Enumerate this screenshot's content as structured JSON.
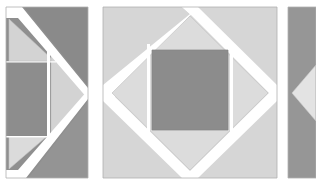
{
  "figure": {
    "canvas": {
      "width": 316,
      "height": 185,
      "background": "#ffffff"
    },
    "palette": {
      "dark_gray": "#8c8c8c",
      "mid_gray": "#9a9a9a",
      "light_gray": "#d4d4d4",
      "pale_gray": "#dcdcdc",
      "very_light_gray": "#e3e3e3",
      "white_gap": "#ffffff",
      "outline": "#b5b5b5"
    },
    "panels": [
      {
        "id": "panel-left",
        "label": "Left panel",
        "x": 6,
        "y": 7,
        "width": 82,
        "height": 171,
        "base_fill": "#8c8c8c",
        "shapes": [
          {
            "name": "upper-left-triangle",
            "fill": "#d4d4d4",
            "points": "6,17 6,62 58,62"
          },
          {
            "name": "left-rectangle",
            "fill": "#8e8e8e",
            "points": "6,62 46,62 46,137 6,137"
          },
          {
            "name": "lower-left-triangle",
            "fill": "#dcdcdc",
            "points": "6,137 46,137 6,172"
          },
          {
            "name": "inner-right-triangle",
            "fill": "#d4d4d4",
            "points": "50,50 50,140 86,95"
          },
          {
            "name": "upper-right-dark",
            "fill": "#8c8c8c",
            "points": "22,7 88,7 88,88"
          },
          {
            "name": "lower-right-dark",
            "fill": "#969696",
            "points": "88,100 88,178 26,178"
          }
        ]
      },
      {
        "id": "panel-middle",
        "label": "Middle panel",
        "x": 103,
        "y": 7,
        "width": 174,
        "height": 171,
        "base_fill": "#d6d6d6",
        "shapes": [
          {
            "name": "background-square",
            "fill": "#d6d6d6",
            "points": "103,7 277,7 277,178 103,178"
          },
          {
            "name": "inner-diamond",
            "fill": "#dcdcdc",
            "points": "190,16 268,93 190,170 112,93"
          },
          {
            "name": "center-square",
            "fill": "#8c8c8c",
            "points": "152,50 228,50 228,130 152,130"
          }
        ],
        "gaps": [
          {
            "name": "diamond-gap-top-left",
            "points": "103,7 190,7 190,16 112,93 103,93"
          },
          {
            "name": "diamond-gap-top-right",
            "points": "190,7 277,7 277,93 268,93 190,16"
          },
          {
            "name": "diamond-gap-bottom-right",
            "points": "277,93 277,178 190,178 190,170 268,93"
          },
          {
            "name": "diamond-gap-bottom-left",
            "points": "103,93 112,93 190,170 190,178 103,178"
          }
        ]
      },
      {
        "id": "panel-right",
        "label": "Right panel (clipped by canvas edge)",
        "x": 288,
        "y": 7,
        "width": 28,
        "height": 171,
        "base_fill": "#969696",
        "shapes": [
          {
            "name": "right-base-rect",
            "fill": "#969696",
            "points": "288,7 316,7 316,178 288,178"
          },
          {
            "name": "left-pointing-triangle",
            "fill": "#e3e3e3",
            "points": "293,93 316,66 316,122"
          }
        ]
      }
    ]
  }
}
